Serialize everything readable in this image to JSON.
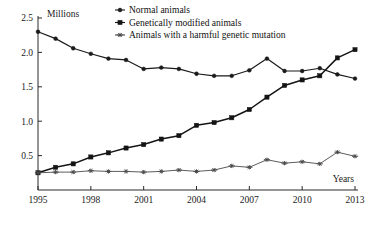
{
  "chart_data": {
    "type": "line",
    "title": "",
    "xlabel": "Years",
    "ylabel": "Millions",
    "x": [
      1995,
      1996,
      1997,
      1998,
      1999,
      2000,
      2001,
      2002,
      2003,
      2004,
      2005,
      2006,
      2007,
      2008,
      2009,
      2010,
      2011,
      2012,
      2013
    ],
    "xlim": [
      1995,
      2013
    ],
    "ylim": [
      0,
      2.5
    ],
    "xticks": [
      1995,
      1998,
      2001,
      2004,
      2007,
      2010,
      2013
    ],
    "xtick_labels": [
      "1995",
      "1998",
      "2001",
      "2004",
      "2007",
      "2010",
      "2013"
    ],
    "yticks": [
      0.5,
      1.0,
      1.5,
      2.0,
      2.5
    ],
    "ytick_labels": [
      "0.5",
      "1.0",
      "1.5",
      "2.0",
      "2.5"
    ],
    "grid": false,
    "legend_position": "top-center",
    "series": [
      {
        "name": "Normal animals",
        "marker": "dot-with-line",
        "color": "#1a1a1a",
        "values": [
          2.3,
          2.2,
          2.06,
          1.98,
          1.91,
          1.89,
          1.76,
          1.78,
          1.76,
          1.69,
          1.66,
          1.66,
          1.74,
          1.91,
          1.73,
          1.73,
          1.77,
          1.68,
          1.62
        ]
      },
      {
        "name": "Genetically modified animals",
        "marker": "square",
        "color": "#141414",
        "values": [
          0.25,
          0.33,
          0.38,
          0.48,
          0.54,
          0.61,
          0.66,
          0.74,
          0.79,
          0.94,
          0.98,
          1.05,
          1.17,
          1.35,
          1.52,
          1.6,
          1.66,
          1.92,
          2.04
        ]
      },
      {
        "name": "Animals with a harmful genetic mutation",
        "marker": "star",
        "color": "#4a4a4a",
        "values": [
          0.25,
          0.26,
          0.26,
          0.28,
          0.27,
          0.27,
          0.26,
          0.27,
          0.29,
          0.27,
          0.29,
          0.35,
          0.33,
          0.44,
          0.39,
          0.41,
          0.38,
          0.55,
          0.49
        ]
      }
    ],
    "legend_entries": [
      "Normal animals",
      "Genetically modified animals",
      "Animals with a harmful genetic mutation"
    ],
    "axis_label_top": "Millions",
    "axis_label_right": "Years"
  },
  "layout": {
    "plot_left": 38,
    "plot_right": 355,
    "plot_top": 18,
    "plot_bottom": 190,
    "y_axis_top_value": 2.5,
    "y_axis_bottom_value": 0.0
  }
}
